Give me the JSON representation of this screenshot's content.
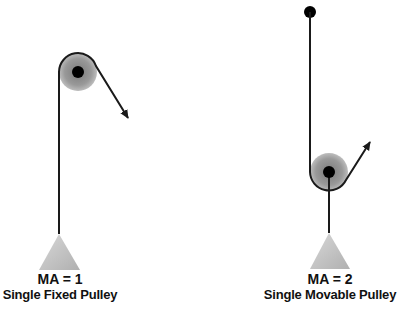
{
  "diagrams": [
    {
      "id": "fixed",
      "ma_label": "MA = 1",
      "title": "Single Fixed Pulley"
    },
    {
      "id": "movable",
      "ma_label": "MA = 2",
      "title": "Single Movable Pulley"
    }
  ],
  "colors": {
    "rope": "#1a1a1a",
    "wheel_outer": "#a8a8a8",
    "wheel_inner": "#8a8a8a",
    "axle": "#000000",
    "weight": "#c4c4c4"
  }
}
